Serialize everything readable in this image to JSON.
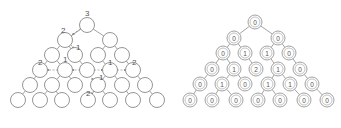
{
  "left_tree": {
    "node_radius": 7.5,
    "nodes": [
      {
        "id": "a",
        "x": 87,
        "y": 25
      },
      {
        "id": "b",
        "x": 65,
        "y": 40
      },
      {
        "id": "c",
        "x": 110,
        "y": 40
      },
      {
        "id": "d",
        "x": 52,
        "y": 55
      },
      {
        "id": "e",
        "x": 75,
        "y": 55
      },
      {
        "id": "f",
        "x": 98,
        "y": 55
      },
      {
        "id": "g",
        "x": 122,
        "y": 55
      },
      {
        "id": "h",
        "x": 40,
        "y": 70
      },
      {
        "id": "i",
        "x": 65,
        "y": 70
      },
      {
        "id": "j",
        "x": 87,
        "y": 70
      },
      {
        "id": "k",
        "x": 110,
        "y": 70
      },
      {
        "id": "l",
        "x": 133,
        "y": 70
      },
      {
        "id": "m",
        "x": 30,
        "y": 85
      },
      {
        "id": "n",
        "x": 52,
        "y": 85
      },
      {
        "id": "o",
        "x": 75,
        "y": 85
      },
      {
        "id": "p",
        "x": 98,
        "y": 85
      },
      {
        "id": "q",
        "x": 122,
        "y": 85
      },
      {
        "id": "r",
        "x": 145,
        "y": 85
      },
      {
        "id": "s",
        "x": 18,
        "y": 100
      },
      {
        "id": "t",
        "x": 40,
        "y": 100
      },
      {
        "id": "u",
        "x": 62,
        "y": 100
      },
      {
        "id": "v",
        "x": 88,
        "y": 100
      },
      {
        "id": "w",
        "x": 110,
        "y": 100
      },
      {
        "id": "x",
        "x": 133,
        "y": 100
      },
      {
        "id": "y",
        "x": 157,
        "y": 100
      }
    ],
    "edges": [
      [
        "a",
        "b"
      ],
      [
        "a",
        "c"
      ],
      [
        "b",
        "d"
      ],
      [
        "b",
        "e"
      ],
      [
        "c",
        "f"
      ],
      [
        "c",
        "g"
      ],
      [
        "d",
        "h"
      ],
      [
        "d",
        "i"
      ],
      [
        "e",
        "j"
      ],
      [
        "f",
        "k"
      ],
      [
        "g",
        "l"
      ],
      [
        "h",
        "m"
      ],
      [
        "i",
        "n"
      ],
      [
        "i",
        "o"
      ],
      [
        "k",
        "p"
      ],
      [
        "k",
        "q"
      ],
      [
        "l",
        "r"
      ],
      [
        "m",
        "s"
      ],
      [
        "n",
        "t"
      ],
      [
        "n",
        "u"
      ],
      [
        "p",
        "v"
      ],
      [
        "p",
        "w"
      ],
      [
        "q",
        "x"
      ],
      [
        "r",
        "y"
      ]
    ],
    "labels": [
      {
        "text": "3",
        "x": 85,
        "y": 16
      },
      {
        "text": "2",
        "x": 61,
        "y": 33
      },
      {
        "text": "1",
        "x": 76,
        "y": 50
      },
      {
        "text": "2",
        "x": 38,
        "y": 65
      },
      {
        "text": "1",
        "x": 63,
        "y": 62
      },
      {
        "text": "1",
        "x": 108,
        "y": 65
      },
      {
        "text": "2",
        "x": 132,
        "y": 65
      },
      {
        "text": "1",
        "x": 99,
        "y": 80
      },
      {
        "text": "2",
        "x": 86,
        "y": 96
      }
    ],
    "arrows": [
      {
        "from": [
          80,
          29
        ],
        "to": [
          72,
          35
        ]
      },
      {
        "from": [
          71,
          45
        ],
        "to": [
          74,
          49
        ]
      },
      {
        "from": [
          58,
          70
        ],
        "to": [
          47,
          70
        ]
      },
      {
        "from": [
          80,
          70
        ],
        "to": [
          72,
          70
        ]
      },
      {
        "from": [
          94,
          70
        ],
        "to": [
          103,
          70
        ]
      },
      {
        "from": [
          117,
          70
        ],
        "to": [
          126,
          70
        ]
      },
      {
        "from": [
          91,
          78
        ],
        "to": [
          94,
          80
        ]
      },
      {
        "from": [
          94,
          90
        ],
        "to": [
          91,
          95
        ]
      }
    ]
  },
  "right_tree": {
    "outer_radius": 7,
    "inner_radius": 5,
    "nodes": [
      {
        "id": "a",
        "x": 255,
        "y": 22,
        "value": "0"
      },
      {
        "id": "b",
        "x": 234,
        "y": 38,
        "value": "0"
      },
      {
        "id": "c",
        "x": 278,
        "y": 38,
        "value": "0"
      },
      {
        "id": "d",
        "x": 223,
        "y": 53,
        "value": "0"
      },
      {
        "id": "e",
        "x": 245,
        "y": 53,
        "value": "1"
      },
      {
        "id": "f",
        "x": 267,
        "y": 53,
        "value": "1"
      },
      {
        "id": "g",
        "x": 289,
        "y": 53,
        "value": "0"
      },
      {
        "id": "h",
        "x": 212,
        "y": 69,
        "value": "0"
      },
      {
        "id": "i",
        "x": 234,
        "y": 69,
        "value": "1"
      },
      {
        "id": "j",
        "x": 256,
        "y": 69,
        "value": "2"
      },
      {
        "id": "k",
        "x": 278,
        "y": 69,
        "value": "1"
      },
      {
        "id": "l",
        "x": 300,
        "y": 69,
        "value": "0"
      },
      {
        "id": "m",
        "x": 200,
        "y": 84,
        "value": "0"
      },
      {
        "id": "n",
        "x": 222,
        "y": 84,
        "value": "1"
      },
      {
        "id": "o",
        "x": 245,
        "y": 84,
        "value": "0"
      },
      {
        "id": "p",
        "x": 268,
        "y": 84,
        "value": "1"
      },
      {
        "id": "q",
        "x": 290,
        "y": 84,
        "value": "1"
      },
      {
        "id": "r",
        "x": 312,
        "y": 84,
        "value": "0"
      },
      {
        "id": "s",
        "x": 190,
        "y": 100,
        "value": "0"
      },
      {
        "id": "t",
        "x": 212,
        "y": 100,
        "value": "0"
      },
      {
        "id": "u",
        "x": 236,
        "y": 100,
        "value": "0"
      },
      {
        "id": "v",
        "x": 258,
        "y": 100,
        "value": "0"
      },
      {
        "id": "w",
        "x": 280,
        "y": 100,
        "value": "0"
      },
      {
        "id": "x",
        "x": 304,
        "y": 100,
        "value": "0"
      },
      {
        "id": "y",
        "x": 327,
        "y": 100,
        "value": "0"
      }
    ],
    "edges": [
      [
        "a",
        "b"
      ],
      [
        "a",
        "c"
      ],
      [
        "b",
        "d"
      ],
      [
        "b",
        "e"
      ],
      [
        "c",
        "f"
      ],
      [
        "c",
        "g"
      ],
      [
        "d",
        "h"
      ],
      [
        "d",
        "i"
      ],
      [
        "e",
        "j"
      ],
      [
        "f",
        "k"
      ],
      [
        "g",
        "l"
      ],
      [
        "h",
        "m"
      ],
      [
        "i",
        "n"
      ],
      [
        "i",
        "o"
      ],
      [
        "k",
        "p"
      ],
      [
        "k",
        "q"
      ],
      [
        "l",
        "r"
      ],
      [
        "m",
        "s"
      ],
      [
        "n",
        "t"
      ],
      [
        "n",
        "u"
      ],
      [
        "p",
        "v"
      ],
      [
        "p",
        "w"
      ],
      [
        "q",
        "x"
      ],
      [
        "r",
        "y"
      ]
    ]
  }
}
